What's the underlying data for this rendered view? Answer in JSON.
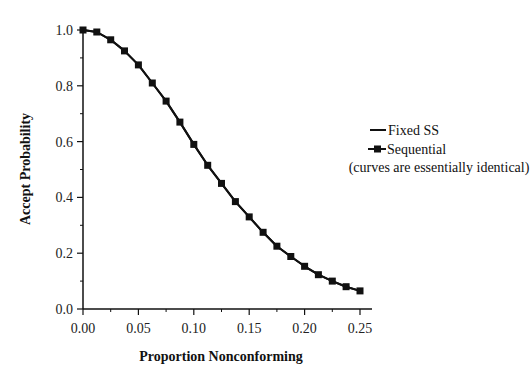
{
  "chart_data": {
    "type": "line",
    "title": "",
    "xlabel": "Proportion Nonconforming",
    "ylabel": "Accept Probability",
    "xlim": [
      0,
      0.25
    ],
    "ylim": [
      0,
      1.0
    ],
    "grid": false,
    "legend_position": "right",
    "x_ticks": [
      "0.00",
      "0.05",
      "0.10",
      "0.15",
      "0.20",
      "0.25"
    ],
    "y_ticks": [
      "0.0",
      "0.2",
      "0.4",
      "0.6",
      "0.8",
      "1.0"
    ],
    "x": [
      0.0,
      0.0125,
      0.025,
      0.0375,
      0.05,
      0.0625,
      0.075,
      0.0875,
      0.1,
      0.1125,
      0.125,
      0.1375,
      0.15,
      0.1625,
      0.175,
      0.1875,
      0.2,
      0.2125,
      0.225,
      0.2375,
      0.25
    ],
    "series": [
      {
        "name": "Fixed SS",
        "marker": "none",
        "values": [
          1.0,
          0.993,
          0.965,
          0.925,
          0.875,
          0.81,
          0.745,
          0.67,
          0.59,
          0.515,
          0.45,
          0.385,
          0.33,
          0.275,
          0.225,
          0.188,
          0.153,
          0.123,
          0.1,
          0.08,
          0.065
        ]
      },
      {
        "name": "Sequential",
        "marker": "square",
        "values": [
          1.0,
          0.993,
          0.965,
          0.925,
          0.875,
          0.81,
          0.745,
          0.67,
          0.59,
          0.515,
          0.45,
          0.385,
          0.33,
          0.275,
          0.225,
          0.188,
          0.153,
          0.123,
          0.1,
          0.08,
          0.065
        ]
      }
    ],
    "annotations": [
      "(curves are essentially identical)"
    ]
  },
  "legend": {
    "items": [
      {
        "label": "Fixed SS"
      },
      {
        "label": "Sequential"
      }
    ],
    "note": "(curves are essentially identical)"
  }
}
